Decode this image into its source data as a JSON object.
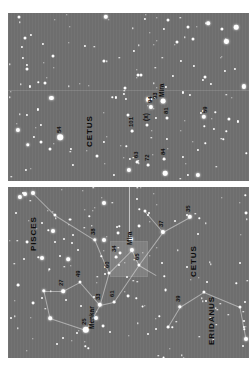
{
  "figure": {
    "background": "#ffffff",
    "sky_color": "#6e6e6e",
    "star_color": "#ffffff",
    "line_color": "#e1e1e1",
    "orientation_note": "plate printed sideways; all labels rotated 90 degrees",
    "panels": [
      {
        "id": "detail",
        "role": "magnified-field",
        "x": 8,
        "y": 13,
        "w": 241,
        "h": 168
      },
      {
        "id": "wide",
        "role": "wide-field",
        "x": 8,
        "y": 187,
        "w": 241,
        "h": 171
      }
    ]
  },
  "chart_data": {
    "type": "scatter",
    "xlabel": "",
    "ylabel": "",
    "grid": false,
    "legend": "none",
    "panels": [
      {
        "name": "detail",
        "caption": "Magnified field around Mira (omicron Ceti)",
        "constellation_labels": [
          {
            "text": "CETUS",
            "x": 78,
            "y": 112
          }
        ],
        "labeled_stars": [
          {
            "label": "54",
            "x": 52,
            "y": 124,
            "mag": 3.9
          },
          {
            "label": "101",
            "x": 124,
            "y": 118,
            "mag": 5.4
          },
          {
            "label": "(x)",
            "x": 139,
            "y": 112,
            "mag": 5.6
          },
          {
            "label": "94",
            "x": 143,
            "y": 94,
            "mag": 5.1
          },
          {
            "label": "93",
            "x": 148,
            "y": 90,
            "mag": 5.6
          },
          {
            "label": "Mira",
            "x": 155,
            "y": 88,
            "mag": 2.5
          },
          {
            "label": "81",
            "x": 159,
            "y": 105,
            "mag": 5.6
          },
          {
            "label": "59",
            "x": 198,
            "y": 104,
            "mag": 4.9
          },
          {
            "label": "84",
            "x": 156,
            "y": 146,
            "mag": 5.7
          },
          {
            "label": "72",
            "x": 140,
            "y": 152,
            "mag": 5.6
          },
          {
            "label": "63",
            "x": 129,
            "y": 149,
            "mag": 5.2
          }
        ]
      },
      {
        "name": "wide",
        "caption": "Wide field: Pisces, Cetus and Eridanus",
        "constellation_labels": [
          {
            "text": "PISCES",
            "x": 22,
            "y": 34
          },
          {
            "text": "CETUS",
            "x": 182,
            "y": 60
          },
          {
            "text": "ERIDANUS",
            "x": 200,
            "y": 128
          }
        ],
        "labeled_stars": [
          {
            "label": "25",
            "x": 78,
            "y": 143,
            "mag": 3.6
          },
          {
            "label": "Menkar",
            "x": 86,
            "y": 147,
            "mag": 2.5
          },
          {
            "label": "27",
            "x": 55,
            "y": 104,
            "mag": 4.3
          },
          {
            "label": "49",
            "x": 72,
            "y": 95,
            "mag": 4.9
          },
          {
            "label": "33",
            "x": 92,
            "y": 118,
            "mag": 4.5
          },
          {
            "label": "38",
            "x": 87,
            "y": 53,
            "mag": 5.7
          },
          {
            "label": "34",
            "x": 108,
            "y": 70,
            "mag": 5.9
          },
          {
            "label": "60",
            "x": 101,
            "y": 86,
            "mag": 5.4
          },
          {
            "label": "61",
            "x": 106,
            "y": 115,
            "mag": 5.9
          },
          {
            "label": "65",
            "x": 131,
            "y": 78,
            "mag": 5.0
          },
          {
            "label": "Mira",
            "x": 124,
            "y": 63,
            "mag": 2.5
          },
          {
            "label": "37",
            "x": 155,
            "y": 45,
            "mag": 5.1
          },
          {
            "label": "35",
            "x": 182,
            "y": 30,
            "mag": 5.9
          },
          {
            "label": "39",
            "x": 172,
            "y": 120,
            "mag": 5.8
          }
        ],
        "highlight_box": {
          "x": 103,
          "y": 55,
          "w": 36,
          "h": 34,
          "note": "field shown magnified in detail panel"
        },
        "leader_line": {
          "from_x": 121,
          "from_y": 55,
          "to_y": -4
        }
      }
    ]
  },
  "labels": {
    "pisces": "PISCES",
    "cetus": "CETUS",
    "eridanus": "ERIDANUS",
    "mira": "Mira",
    "menkar": "Menkar",
    "s25": "25",
    "s27": "27",
    "s33": "33",
    "s34": "34",
    "s35": "35",
    "s37": "37",
    "s38": "38",
    "s39": "39",
    "s49": "49",
    "s54": "54",
    "s59": "59",
    "s60": "60",
    "s61": "61",
    "s63": "63",
    "s65": "65",
    "s72": "72",
    "s81": "81",
    "s84": "84",
    "s93": "93",
    "s94": "94",
    "s101": "101",
    "sx": "(x)"
  }
}
